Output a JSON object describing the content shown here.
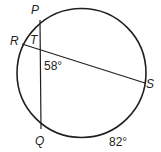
{
  "diagram": {
    "type": "circle-intersecting-chords",
    "points": {
      "P": {
        "label": "P"
      },
      "Q": {
        "label": "Q"
      },
      "R": {
        "label": "R"
      },
      "S": {
        "label": "S"
      },
      "T": {
        "label": "T"
      }
    },
    "chords": [
      "PQ",
      "RS"
    ],
    "intersection": "T",
    "angle_label": "58°",
    "arc_label": "82°",
    "stroke_color": "#231f20"
  }
}
